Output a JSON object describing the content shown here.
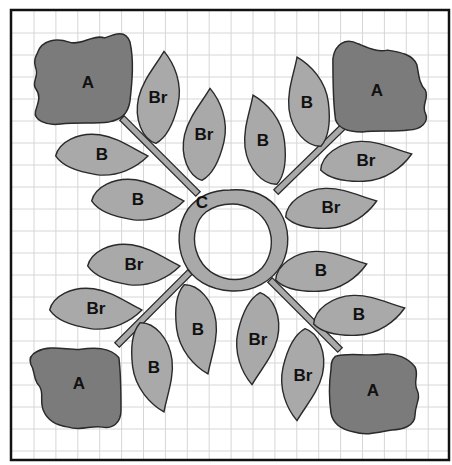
{
  "diagram": {
    "type": "applique-quilt-block",
    "colors": {
      "background": "#ffffff",
      "grid": "#d6d6d6",
      "border": "#111111",
      "flower_fill": "#7b7b7b",
      "leaf_fill": "#a9a9a9",
      "outline": "#2a2a2a"
    },
    "center": {
      "label": "C",
      "x": 230,
      "y": 236
    },
    "flowers": [
      {
        "label": "A",
        "x": 88,
        "y": 82,
        "corner": "top-left"
      },
      {
        "label": "A",
        "x": 377,
        "y": 90,
        "corner": "top-right"
      },
      {
        "label": "A",
        "x": 79,
        "y": 383,
        "corner": "bottom-left"
      },
      {
        "label": "A",
        "x": 373,
        "y": 390,
        "corner": "bottom-right"
      }
    ],
    "leaves": [
      {
        "label": "Br",
        "x": 158,
        "y": 97,
        "rot": -80
      },
      {
        "label": "Br",
        "x": 204,
        "y": 134,
        "rot": -80
      },
      {
        "label": "B",
        "x": 102,
        "y": 154,
        "rot": 5
      },
      {
        "label": "B",
        "x": 138,
        "y": 199,
        "rot": 5
      },
      {
        "label": "B",
        "x": 307,
        "y": 102,
        "rot": -100
      },
      {
        "label": "B",
        "x": 263,
        "y": 140,
        "rot": -100
      },
      {
        "label": "Br",
        "x": 366,
        "y": 160,
        "rot": -5
      },
      {
        "label": "Br",
        "x": 331,
        "y": 207,
        "rot": -5
      },
      {
        "label": "Br",
        "x": 134,
        "y": 264,
        "rot": 5
      },
      {
        "label": "Br",
        "x": 96,
        "y": 308,
        "rot": 5
      },
      {
        "label": "B",
        "x": 198,
        "y": 329,
        "rot": 80
      },
      {
        "label": "B",
        "x": 154,
        "y": 367,
        "rot": 80
      },
      {
        "label": "B",
        "x": 321,
        "y": 270,
        "rot": -5
      },
      {
        "label": "B",
        "x": 359,
        "y": 314,
        "rot": -5
      },
      {
        "label": "Br",
        "x": 258,
        "y": 339,
        "rot": 100
      },
      {
        "label": "Br",
        "x": 303,
        "y": 375,
        "rot": 100
      }
    ],
    "stems": [
      {
        "x1": 122,
        "y1": 118,
        "x2": 198,
        "y2": 194
      },
      {
        "x1": 348,
        "y1": 122,
        "x2": 276,
        "y2": 192
      },
      {
        "x1": 117,
        "y1": 345,
        "x2": 190,
        "y2": 272
      },
      {
        "x1": 340,
        "y1": 350,
        "x2": 270,
        "y2": 280
      }
    ]
  }
}
